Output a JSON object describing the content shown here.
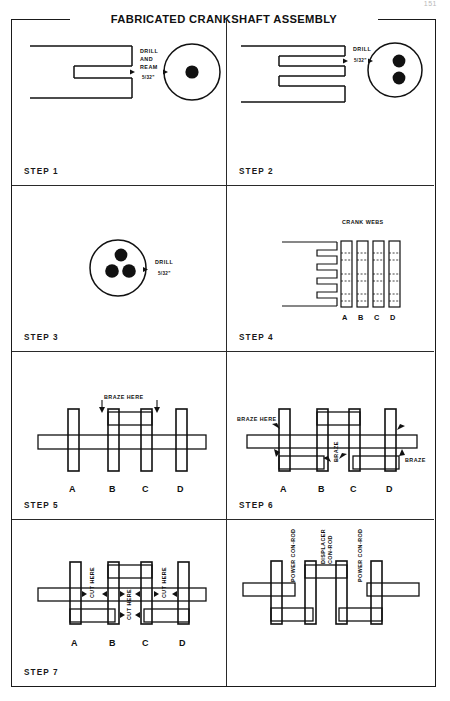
{
  "page": {
    "number": "151",
    "title": "FABRICATED CRANKSHAFT ASSEMBLY"
  },
  "panels": [
    {
      "id": "step-1",
      "step_label": "STEP 1",
      "annotations": [
        {
          "name": "drill-and-ream-note",
          "text_lines": [
            "DRILL",
            "AND",
            "REAM"
          ],
          "dimension": "5/32\""
        }
      ],
      "view": {
        "side": "channel with single slot",
        "end": "round bar end view, 1 hole on centre"
      },
      "holes": 1
    },
    {
      "id": "step-2",
      "step_label": "STEP 2",
      "annotations": [
        {
          "name": "drill-note",
          "text_lines": [
            "DRILL"
          ],
          "dimension": "5/32\""
        }
      ],
      "view": {
        "side": "channel with two slots",
        "end": "round bar end view, 2 holes"
      },
      "holes": 2
    },
    {
      "id": "step-3",
      "step_label": "STEP 3",
      "annotations": [
        {
          "name": "drill-note",
          "text_lines": [
            "DRILL"
          ],
          "dimension": "5/32\""
        }
      ],
      "view": {
        "end": "round bar end view, 3 holes"
      },
      "holes": 3
    },
    {
      "id": "step-4",
      "step_label": "STEP 4",
      "annotations": [
        {
          "name": "crank-webs-note",
          "text_lines": [
            "CRANK WEBS"
          ]
        }
      ],
      "web_letters": [
        "A",
        "B",
        "C",
        "D"
      ]
    },
    {
      "id": "step-5",
      "step_label": "STEP 5",
      "annotations": [
        {
          "name": "braze-here-note",
          "text_lines": [
            "BRAZE HERE"
          ]
        }
      ],
      "web_letters": [
        "A",
        "B",
        "C",
        "D"
      ]
    },
    {
      "id": "step-6",
      "step_label": "STEP 6",
      "annotations": [
        {
          "name": "braze-here-note",
          "text_lines": [
            "BRAZE HERE"
          ]
        },
        {
          "name": "braze-note-centre",
          "text_lines": [
            "BRAZE"
          ]
        },
        {
          "name": "braze-note-right",
          "text_lines": [
            "BRAZE"
          ]
        }
      ],
      "web_letters": [
        "A",
        "B",
        "C",
        "D"
      ]
    },
    {
      "id": "step-7",
      "step_label": "STEP 7",
      "annotations": [
        {
          "name": "cut-here-note-1",
          "text_lines": [
            "CUT HERE"
          ]
        },
        {
          "name": "cut-here-note-2",
          "text_lines": [
            "CUT HERE"
          ]
        },
        {
          "name": "cut-here-note-3",
          "text_lines": [
            "CUT HERE"
          ]
        }
      ],
      "web_letters": [
        "A",
        "B",
        "C",
        "D"
      ]
    },
    {
      "id": "step-8-finished",
      "step_label": "",
      "annotations": [
        {
          "name": "power-con-rod-left",
          "text_lines": [
            "POWER CON-ROD"
          ]
        },
        {
          "name": "displacer-con-rod",
          "text_lines": [
            "DISPLACER",
            "CON-ROD"
          ]
        },
        {
          "name": "power-con-rod-right",
          "text_lines": [
            "POWER CON-ROD"
          ]
        }
      ]
    }
  ],
  "labels": {
    "step1": "STEP 1",
    "step2": "STEP 2",
    "step3": "STEP 3",
    "step4": "STEP 4",
    "step5": "STEP 5",
    "step6": "STEP 6",
    "step7": "STEP 7",
    "drill": "DRILL",
    "and": "AND",
    "ream": "REAM",
    "crank_webs": "CRANK WEBS",
    "braze_here": "BRAZE HERE",
    "braze": "BRAZE",
    "cut_here": "CUT HERE",
    "power_con_rod": "POWER CON-ROD",
    "displacer": "DISPLACER",
    "con_rod": "CON-ROD",
    "dim_5_32": "5/32\"",
    "A": "A",
    "B": "B",
    "C": "C",
    "D": "D"
  },
  "colors": {
    "ink": "#111111",
    "paper": "#ffffff",
    "rule": "#2a2a2a"
  }
}
